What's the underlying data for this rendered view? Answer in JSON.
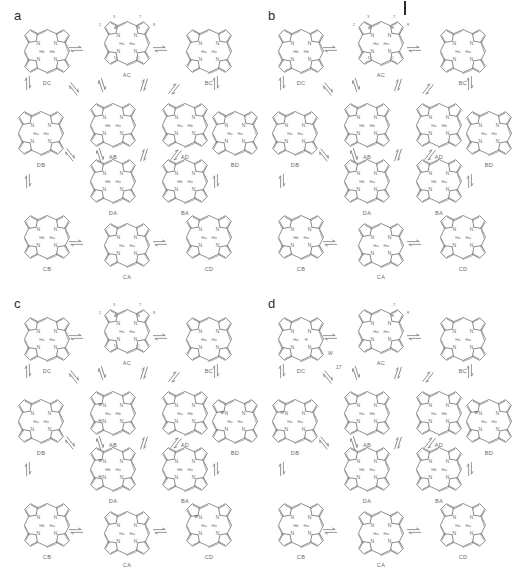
{
  "figure": {
    "type": "tautomer-network-grid",
    "background": "#ffffff",
    "stroke_color": "#6b6b6b",
    "text_color": "#6a6a6a",
    "panel_label_color": "#2d2d2d",
    "top_tick_mark": "|",
    "panel_count": 4
  },
  "panels": [
    {
      "id": "a",
      "label": "a",
      "charged": false,
      "annotations": [],
      "nodes": [
        {
          "id": "DC",
          "label": "DC",
          "row": 0,
          "col": 0,
          "nh": [
            "Hb",
            "Hb"
          ],
          "ring_labels": [],
          "pos_labels": []
        },
        {
          "id": "AC",
          "label": "AC",
          "row": 0,
          "col": 1,
          "nh": [
            "Ha",
            "Ha"
          ],
          "ring_labels": [
            "A",
            "B",
            "C",
            "D"
          ],
          "pos_labels": [
            "2",
            "3",
            "7",
            "8"
          ]
        },
        {
          "id": "BC",
          "label": "BC",
          "row": 0,
          "col": 2,
          "nh": [
            "Ha",
            "Ha"
          ],
          "ring_labels": [],
          "pos_labels": []
        },
        {
          "id": "DB",
          "label": "DB",
          "row": 1,
          "col": 0,
          "nh": [
            "Ha",
            "Ha"
          ],
          "ring_labels": [],
          "pos_labels": []
        },
        {
          "id": "AB",
          "label": "AB",
          "row": 1,
          "col": 1,
          "nh": [
            "Hb",
            "Ha"
          ],
          "ring_labels": [],
          "pos_labels": []
        },
        {
          "id": "AD",
          "label": "AD",
          "row": 1,
          "col": 2,
          "nh": [
            "Ha",
            "Hb"
          ],
          "ring_labels": [],
          "pos_labels": []
        },
        {
          "id": "BD",
          "label": "BD",
          "row": 1,
          "col": 3,
          "nh": [
            "Ha",
            "Ha"
          ],
          "ring_labels": [],
          "pos_labels": []
        },
        {
          "id": "DA",
          "label": "DA",
          "row": 2,
          "col": 1,
          "nh": [
            "Hb",
            "Ha"
          ],
          "ring_labels": [],
          "pos_labels": []
        },
        {
          "id": "BA",
          "label": "BA",
          "row": 2,
          "col": 2,
          "nh": [
            "Hb",
            "Ha"
          ],
          "ring_labels": [],
          "pos_labels": []
        },
        {
          "id": "CB",
          "label": "CB",
          "row": 3,
          "col": 0,
          "nh": [
            "Hb",
            "Ha"
          ],
          "ring_labels": [],
          "pos_labels": []
        },
        {
          "id": "CA",
          "label": "CA",
          "row": 3,
          "col": 1,
          "nh": [
            "Ha",
            "Ha"
          ],
          "ring_labels": [],
          "pos_labels": []
        },
        {
          "id": "CD",
          "label": "CD",
          "row": 3,
          "col": 2,
          "nh": [
            "Ha",
            "Ha"
          ],
          "ring_labels": [],
          "pos_labels": []
        }
      ]
    },
    {
      "id": "b",
      "label": "b",
      "charged": false,
      "annotations": [],
      "nodes": [
        {
          "id": "DC",
          "label": "DC",
          "row": 0,
          "col": 0,
          "nh": [
            "Hb",
            "Hb"
          ],
          "ring_labels": [],
          "pos_labels": []
        },
        {
          "id": "AC",
          "label": "AC",
          "row": 0,
          "col": 1,
          "nh": [
            "Ha",
            "Ha"
          ],
          "ring_labels": [
            "A",
            "B",
            "C",
            "D"
          ],
          "pos_labels": [
            "2",
            "3",
            "7",
            "8"
          ]
        },
        {
          "id": "BC",
          "label": "BC",
          "row": 0,
          "col": 2,
          "nh": [
            "Ha",
            "Ha"
          ],
          "ring_labels": [],
          "pos_labels": []
        },
        {
          "id": "DB",
          "label": "DB",
          "row": 1,
          "col": 0,
          "nh": [
            "Ha",
            "Ha"
          ],
          "ring_labels": [],
          "pos_labels": []
        },
        {
          "id": "AB",
          "label": "AB",
          "row": 1,
          "col": 1,
          "nh": [
            "Hb",
            "Hb"
          ],
          "ring_labels": [],
          "pos_labels": []
        },
        {
          "id": "AD",
          "label": "AD",
          "row": 1,
          "col": 2,
          "nh": [
            "Ha",
            "Hb"
          ],
          "ring_labels": [],
          "pos_labels": []
        },
        {
          "id": "BD",
          "label": "BD",
          "row": 1,
          "col": 3,
          "nh": [
            "Ha",
            "Ha"
          ],
          "ring_labels": [],
          "pos_labels": []
        },
        {
          "id": "DA",
          "label": "DA",
          "row": 2,
          "col": 1,
          "nh": [
            "Hb",
            "Ha"
          ],
          "ring_labels": [],
          "pos_labels": []
        },
        {
          "id": "BA",
          "label": "BA",
          "row": 2,
          "col": 2,
          "nh": [
            "Hb",
            "Ha"
          ],
          "ring_labels": [],
          "pos_labels": []
        },
        {
          "id": "CB",
          "label": "CB",
          "row": 3,
          "col": 0,
          "nh": [
            "Hb",
            "Ha"
          ],
          "ring_labels": [],
          "pos_labels": []
        },
        {
          "id": "CA",
          "label": "CA",
          "row": 3,
          "col": 1,
          "nh": [
            "Ha",
            "Ha"
          ],
          "ring_labels": [],
          "pos_labels": []
        },
        {
          "id": "CD",
          "label": "CD",
          "row": 3,
          "col": 2,
          "nh": [
            "Ha",
            "Ha"
          ],
          "ring_labels": [],
          "pos_labels": []
        }
      ]
    },
    {
      "id": "c",
      "label": "c",
      "charged": true,
      "annotations": [],
      "nodes": [
        {
          "id": "DC",
          "label": "DC",
          "row": 0,
          "col": 0,
          "nh": [
            "Ha",
            "Ha"
          ],
          "ring_labels": [],
          "pos_labels": []
        },
        {
          "id": "AC",
          "label": "AC",
          "row": 0,
          "col": 1,
          "nh": [
            "Ha",
            "Ha"
          ],
          "ring_labels": [
            "A",
            "B",
            "C",
            "D"
          ],
          "pos_labels": [
            "2",
            "3",
            "7",
            "8"
          ]
        },
        {
          "id": "BC",
          "label": "BC",
          "row": 0,
          "col": 2,
          "nh": [
            "Ha",
            "Ha"
          ],
          "ring_labels": [],
          "pos_labels": []
        },
        {
          "id": "DB",
          "label": "DB",
          "row": 1,
          "col": 0,
          "nh": [
            "Ha",
            "Ha"
          ],
          "ring_labels": [],
          "pos_labels": []
        },
        {
          "id": "AB",
          "label": "AB",
          "row": 1,
          "col": 1,
          "nh": [
            "Ha",
            "Hb"
          ],
          "ring_labels": [],
          "pos_labels": [],
          "charges": [
            "+",
            "-"
          ]
        },
        {
          "id": "AD",
          "label": "AD",
          "row": 1,
          "col": 2,
          "nh": [
            "Ha",
            "Hb"
          ],
          "ring_labels": [],
          "pos_labels": []
        },
        {
          "id": "BD",
          "label": "BD",
          "row": 1,
          "col": 3,
          "nh": [
            "Ha",
            "Ha"
          ],
          "ring_labels": [],
          "pos_labels": [],
          "charges": [
            "+"
          ]
        },
        {
          "id": "DA",
          "label": "DA",
          "row": 2,
          "col": 1,
          "nh": [
            "Hb",
            "Ha"
          ],
          "ring_labels": [],
          "pos_labels": [],
          "charges": [
            "+",
            "-"
          ]
        },
        {
          "id": "BA",
          "label": "BA",
          "row": 2,
          "col": 2,
          "nh": [
            "Hb",
            "Ha"
          ],
          "ring_labels": [],
          "pos_labels": []
        },
        {
          "id": "CB",
          "label": "CB",
          "row": 3,
          "col": 0,
          "nh": [
            "Hb",
            "Ha"
          ],
          "ring_labels": [],
          "pos_labels": []
        },
        {
          "id": "CA",
          "label": "CA",
          "row": 3,
          "col": 1,
          "nh": [
            "Ha",
            "Ha"
          ],
          "ring_labels": [],
          "pos_labels": []
        },
        {
          "id": "CD",
          "label": "CD",
          "row": 3,
          "col": 2,
          "nh": [
            "Ha",
            "Ha"
          ],
          "ring_labels": [],
          "pos_labels": [],
          "charges": [
            "+"
          ]
        }
      ]
    },
    {
      "id": "d",
      "label": "d",
      "charged": true,
      "annotations": [
        "W",
        "17"
      ],
      "nodes": [
        {
          "id": "DC",
          "label": "DC",
          "row": 0,
          "col": 0,
          "nh": [
            "Ha",
            "H"
          ],
          "ring_labels": [],
          "pos_labels": []
        },
        {
          "id": "AC",
          "label": "AC",
          "row": 0,
          "col": 1,
          "nh": [
            "Ha",
            "Ha"
          ],
          "ring_labels": [
            "B"
          ],
          "pos_labels": [
            "7",
            "8"
          ]
        },
        {
          "id": "BC",
          "label": "BC",
          "row": 0,
          "col": 2,
          "nh": [
            "Ha",
            "Ha"
          ],
          "ring_labels": [],
          "pos_labels": []
        },
        {
          "id": "DB",
          "label": "DB",
          "row": 1,
          "col": 0,
          "nh": [
            "Ha",
            "Ha"
          ],
          "ring_labels": [],
          "pos_labels": [],
          "charges": [
            "-"
          ]
        },
        {
          "id": "AB",
          "label": "AB",
          "row": 1,
          "col": 1,
          "nh": [
            "Ha",
            "Hb"
          ],
          "ring_labels": [],
          "pos_labels": []
        },
        {
          "id": "AD",
          "label": "AD",
          "row": 1,
          "col": 2,
          "nh": [
            "Ha",
            "Hb"
          ],
          "ring_labels": [],
          "pos_labels": []
        },
        {
          "id": "BD",
          "label": "BD",
          "row": 1,
          "col": 3,
          "nh": [
            "Ha",
            "Ha"
          ],
          "ring_labels": [],
          "pos_labels": [],
          "charges": [
            "+"
          ]
        },
        {
          "id": "DA",
          "label": "DA",
          "row": 2,
          "col": 1,
          "nh": [
            "Hb",
            "Ha"
          ],
          "ring_labels": [],
          "pos_labels": []
        },
        {
          "id": "BA",
          "label": "BA",
          "row": 2,
          "col": 2,
          "nh": [
            "Hb",
            "Ha"
          ],
          "ring_labels": [],
          "pos_labels": []
        },
        {
          "id": "CB",
          "label": "CB",
          "row": 3,
          "col": 0,
          "nh": [
            "Hb",
            "Ha"
          ],
          "ring_labels": [],
          "pos_labels": []
        },
        {
          "id": "CA",
          "label": "CA",
          "row": 3,
          "col": 1,
          "nh": [
            "Ha",
            "Ha"
          ],
          "ring_labels": [],
          "pos_labels": []
        },
        {
          "id": "CD",
          "label": "CD",
          "row": 3,
          "col": 2,
          "nh": [
            "Ha",
            "Ha"
          ],
          "ring_labels": [],
          "pos_labels": []
        }
      ]
    }
  ],
  "legend": {
    "arrow_symbol": "⇌",
    "nitrogen_symbol": "N",
    "hydrogen_a": "Ha",
    "hydrogen_b": "Hb",
    "plus_charge": "⊕",
    "minus_charge": "⊖"
  }
}
